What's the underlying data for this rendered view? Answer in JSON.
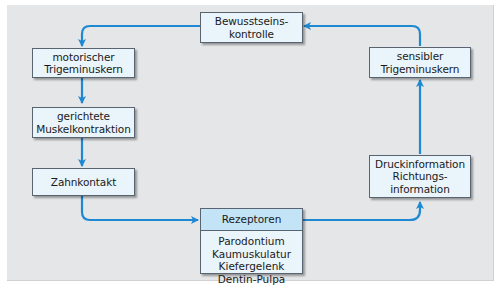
{
  "diagram": {
    "colors": {
      "background_panel": "#e5e6e8",
      "node_fill": "#e9f4fb",
      "node_header_fill": "#c3e3f6",
      "node_border": "#5a6470",
      "arrow": "#1e88d2"
    },
    "nodes": {
      "bewusstseinskontrolle": {
        "lines": [
          "Bewusstseins-",
          "kontrolle"
        ]
      },
      "motorischer_trigeminuskern": {
        "lines": [
          "motorischer",
          "Trigeminuskern"
        ]
      },
      "gerichtete_muskelkontraktion": {
        "lines": [
          "gerichtete",
          "Muskelkontraktion"
        ]
      },
      "zahnkontakt": {
        "lines": [
          "Zahnkontakt"
        ]
      },
      "rezeptoren": {
        "title": "Rezeptoren",
        "items": [
          "Parodontium",
          "Kaumuskulatur",
          "Kiefergelenk",
          "Dentin-Pulpa"
        ]
      },
      "druckinformation": {
        "lines": [
          "Druckinformation",
          "Richtungs-",
          "information"
        ]
      },
      "sensibler_trigeminuskern": {
        "lines": [
          "sensibler",
          "Trigeminuskern"
        ]
      }
    },
    "edges": [
      {
        "from": "Bewusstseinskontrolle",
        "to": "motorischer Trigeminuskern"
      },
      {
        "from": "motorischer Trigeminuskern",
        "to": "gerichtete Muskelkontraktion"
      },
      {
        "from": "gerichtete Muskelkontraktion",
        "to": "Zahnkontakt"
      },
      {
        "from": "Zahnkontakt",
        "to": "Rezeptoren"
      },
      {
        "from": "Rezeptoren",
        "to": "Druckinformation Richtungsinformation"
      },
      {
        "from": "Druckinformation Richtungsinformation",
        "to": "sensibler Trigeminuskern"
      },
      {
        "from": "sensibler Trigeminuskern",
        "to": "Bewusstseinskontrolle"
      }
    ]
  }
}
